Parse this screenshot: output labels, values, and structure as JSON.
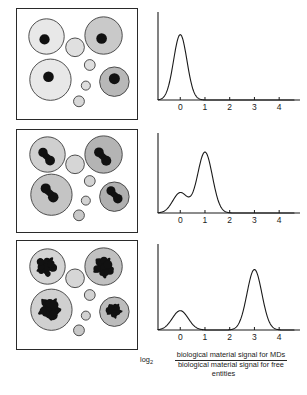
{
  "figure": {
    "caption": {
      "log_prefix": "log",
      "log_base": "2",
      "numerator": "biological material signal for MDs",
      "denominator_line1": "biological material signal for free",
      "denominator_line2": "entities"
    }
  },
  "chart_data": [
    {
      "type": "line",
      "title": "",
      "xlabel": "log2(biological material signal for MDs / biological material signal for free entities)",
      "ylabel": "",
      "xlim": [
        -0.9,
        4.6
      ],
      "ylim": [
        0,
        1
      ],
      "grid": false,
      "legend": null,
      "xticks": [
        0,
        1,
        2,
        3,
        4
      ],
      "xticklabels": [
        "0",
        "1",
        "2",
        "3",
        "4"
      ],
      "peaks": [
        {
          "center": 0,
          "height": 0.76,
          "width": 0.27
        }
      ],
      "x": [
        -0.9,
        -0.7,
        -0.55,
        -0.45,
        -0.35,
        -0.25,
        -0.15,
        -0.05,
        0.0,
        0.05,
        0.15,
        0.25,
        0.35,
        0.45,
        0.55,
        0.7,
        0.9,
        1.5,
        2.5,
        3.5,
        4.5
      ],
      "values": [
        0.0,
        0.0,
        0.01,
        0.03,
        0.1,
        0.28,
        0.55,
        0.73,
        0.76,
        0.75,
        0.63,
        0.39,
        0.17,
        0.05,
        0.01,
        0.0,
        0.0,
        0.0,
        0.0,
        0.0,
        0.0
      ]
    },
    {
      "type": "line",
      "title": "",
      "xlabel": "log2(biological material signal for MDs / biological material signal for free entities)",
      "ylabel": "",
      "xlim": [
        -0.9,
        4.6
      ],
      "ylim": [
        0,
        1
      ],
      "grid": false,
      "legend": null,
      "xticks": [
        0,
        1,
        2,
        3,
        4
      ],
      "xticklabels": [
        "0",
        "1",
        "2",
        "3",
        "4"
      ],
      "peaks": [
        {
          "center": 0,
          "height": 0.26,
          "width": 0.3
        },
        {
          "center": 1,
          "height": 0.78,
          "width": 0.3
        }
      ],
      "x": [
        -0.9,
        -0.6,
        -0.45,
        -0.3,
        -0.15,
        0.0,
        0.15,
        0.3,
        0.45,
        0.55,
        0.65,
        0.75,
        0.85,
        1.0,
        1.15,
        1.3,
        1.45,
        1.6,
        1.8,
        2.2,
        3.0,
        4.0,
        4.5
      ],
      "values": [
        0.0,
        0.01,
        0.05,
        0.14,
        0.23,
        0.26,
        0.23,
        0.13,
        0.04,
        0.03,
        0.14,
        0.45,
        0.7,
        0.78,
        0.7,
        0.43,
        0.14,
        0.03,
        0.0,
        0.0,
        0.0,
        0.0,
        0.0
      ]
    },
    {
      "type": "line",
      "title": "",
      "xlabel": "log2(biological material signal for MDs / biological material signal for free entities)",
      "ylabel": "",
      "xlim": [
        -0.9,
        4.6
      ],
      "ylim": [
        0,
        1
      ],
      "grid": false,
      "legend": null,
      "xticks": [
        0,
        1,
        2,
        3,
        4
      ],
      "xticklabels": [
        "0",
        "1",
        "2",
        "3",
        "4"
      ],
      "peaks": [
        {
          "center": 0,
          "height": 0.23,
          "width": 0.32
        },
        {
          "center": 3,
          "height": 0.72,
          "width": 0.3
        }
      ],
      "x": [
        -0.9,
        -0.6,
        -0.45,
        -0.3,
        -0.15,
        0.0,
        0.15,
        0.3,
        0.45,
        0.6,
        1.0,
        1.5,
        2.0,
        2.45,
        2.6,
        2.75,
        2.9,
        3.0,
        3.15,
        3.3,
        3.45,
        3.6,
        3.8,
        4.2,
        4.5
      ],
      "values": [
        0.0,
        0.01,
        0.05,
        0.13,
        0.21,
        0.23,
        0.2,
        0.11,
        0.03,
        0.0,
        0.0,
        0.0,
        0.0,
        0.01,
        0.1,
        0.4,
        0.66,
        0.72,
        0.68,
        0.44,
        0.13,
        0.02,
        0.0,
        0.0,
        0.0
      ]
    }
  ],
  "panels": [
    {
      "name": "free-entities-panel",
      "inclusion_style": "single-round",
      "cells": [
        {
          "cx": 30,
          "cy": 28,
          "r": 18,
          "fill": "#e8e8e8",
          "inclusion": {
            "cx": 28,
            "cy": 31,
            "r": 5.2
          }
        },
        {
          "cx": 88,
          "cy": 27,
          "r": 19,
          "fill": "#c9c9c9",
          "inclusion": {
            "cx": 86,
            "cy": 30,
            "r": 5.4
          }
        },
        {
          "cx": 59,
          "cy": 39,
          "r": 9.5,
          "fill": "#e0e0e0",
          "inclusion": null
        },
        {
          "cx": 34,
          "cy": 72,
          "r": 21,
          "fill": "#e8e8e8",
          "inclusion": {
            "cx": 32,
            "cy": 69,
            "r": 5.4
          }
        },
        {
          "cx": 99,
          "cy": 74,
          "r": 15,
          "fill": "#b8b8b8",
          "inclusion": {
            "cx": 99,
            "cy": 71,
            "r": 5.6
          }
        },
        {
          "cx": 74,
          "cy": 57,
          "r": 5.5,
          "fill": "#dedede",
          "inclusion": null
        },
        {
          "cx": 70,
          "cy": 78,
          "r": 4.6,
          "fill": "#dedede",
          "inclusion": null
        },
        {
          "cx": 63,
          "cy": 94,
          "r": 5.5,
          "fill": "#d8d8d8",
          "inclusion": null
        }
      ]
    },
    {
      "name": "doublet-panel",
      "inclusion_style": "doublet",
      "cells": [
        {
          "cx": 31,
          "cy": 25,
          "r": 18,
          "fill": "#cfcfcf",
          "inclusion": {
            "cx": 30,
            "cy": 27,
            "r": 5.8
          }
        },
        {
          "cx": 88,
          "cy": 25,
          "r": 19,
          "fill": "#b4b4b4",
          "inclusion": {
            "cx": 87,
            "cy": 27,
            "r": 6.0
          }
        },
        {
          "cx": 59,
          "cy": 35,
          "r": 9.5,
          "fill": "#d6d6d6",
          "inclusion": null
        },
        {
          "cx": 35,
          "cy": 66,
          "r": 21,
          "fill": "#c4c4c4",
          "inclusion": {
            "cx": 33,
            "cy": 64,
            "r": 6.2
          }
        },
        {
          "cx": 99,
          "cy": 68,
          "r": 15,
          "fill": "#b0b0b0",
          "inclusion": {
            "cx": 99,
            "cy": 66,
            "r": 5.6
          }
        },
        {
          "cx": 74,
          "cy": 52,
          "r": 5.5,
          "fill": "#d2d2d2",
          "inclusion": null
        },
        {
          "cx": 70,
          "cy": 72,
          "r": 4.6,
          "fill": "#d2d2d2",
          "inclusion": null
        },
        {
          "cx": 63,
          "cy": 87,
          "r": 5.5,
          "fill": "#c8c8c8",
          "inclusion": null
        }
      ]
    },
    {
      "name": "aggregate-panel",
      "inclusion_style": "aggregate",
      "cells": [
        {
          "cx": 31,
          "cy": 26,
          "r": 18,
          "fill": "#d4d4d4",
          "inclusion": {
            "cx": 30,
            "cy": 26,
            "r": 10.5
          }
        },
        {
          "cx": 88,
          "cy": 26,
          "r": 19,
          "fill": "#c0c0c0",
          "inclusion": {
            "cx": 88,
            "cy": 27,
            "r": 11.0
          }
        },
        {
          "cx": 59,
          "cy": 38,
          "r": 9.5,
          "fill": "#d6d6d6",
          "inclusion": null
        },
        {
          "cx": 35,
          "cy": 70,
          "r": 21,
          "fill": "#d0d0d0",
          "inclusion": {
            "cx": 33,
            "cy": 69,
            "r": 12.0
          }
        },
        {
          "cx": 99,
          "cy": 72,
          "r": 15,
          "fill": "#bcbcbc",
          "inclusion": {
            "cx": 99,
            "cy": 71,
            "r": 8.0
          }
        },
        {
          "cx": 74,
          "cy": 55,
          "r": 5.5,
          "fill": "#d2d2d2",
          "inclusion": null
        },
        {
          "cx": 70,
          "cy": 76,
          "r": 4.6,
          "fill": "#d2d2d2",
          "inclusion": null
        },
        {
          "cx": 63,
          "cy": 91,
          "r": 5.5,
          "fill": "#c8c8c8",
          "inclusion": null
        }
      ]
    }
  ]
}
